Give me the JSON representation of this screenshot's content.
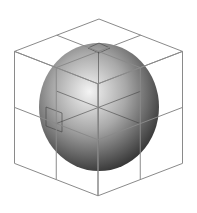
{
  "diagram": {
    "colors": {
      "background": "#ffffff",
      "grid_line": "#8a8a8a",
      "sphere_highlight": "#f4f4f4",
      "sphere_mid": "#a8a8a8",
      "sphere_shadow": "#2a2a2a"
    },
    "sphere": {
      "cx": 99,
      "cy": 107,
      "rx": 60,
      "ry": 64
    },
    "cube": {
      "grid": [
        2,
        2,
        2
      ],
      "top_vertex": [
        99,
        19
      ],
      "vertices": {
        "top": [
          99,
          19
        ],
        "upper_left": [
          57,
          35
        ],
        "upper_right": [
          141,
          35
        ],
        "top_left": [
          14,
          52
        ],
        "top_right": [
          182,
          52
        ],
        "front_top": [
          99,
          83
        ],
        "mid_left": [
          14,
          108
        ],
        "mid_right": [
          182,
          108
        ],
        "center": [
          99,
          140
        ],
        "bottom_left": [
          14,
          164
        ],
        "bottom_right": [
          182,
          164
        ],
        "bottom": [
          99,
          197
        ]
      }
    }
  }
}
